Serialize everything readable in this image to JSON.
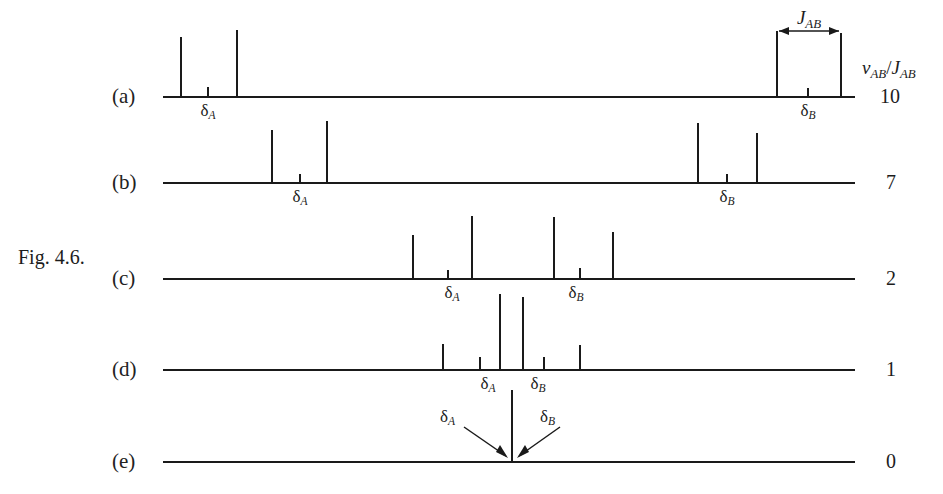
{
  "figure": {
    "caption": "Fig. 4.6.",
    "ratio_header_numerator": "ν",
    "ratio_header_num_sub": "AB",
    "ratio_header_denominator": "J",
    "ratio_header_den_sub": "AB",
    "j_coupling_label": "J",
    "j_coupling_sub": "AB",
    "delta_a_label": "δ",
    "delta_a_sub": "A",
    "delta_b_label": "δ",
    "delta_b_sub": "B"
  },
  "rows": [
    {
      "tag": "(a)",
      "ratio": "10",
      "baseline_y": 97,
      "tag_x": 112,
      "tag_y": 86
    },
    {
      "tag": "(b)",
      "ratio": "7",
      "baseline_y": 183,
      "tag_x": 112,
      "tag_y": 172
    },
    {
      "tag": "(c)",
      "ratio": "2",
      "baseline_y": 279,
      "tag_x": 112,
      "tag_y": 268
    },
    {
      "tag": "(d)",
      "ratio": "1",
      "baseline_y": 370,
      "tag_x": 112,
      "tag_y": 359
    },
    {
      "tag": "(e)",
      "ratio": "0",
      "baseline_y": 462,
      "tag_x": 112,
      "tag_y": 451
    }
  ],
  "chart_data": {
    "type": "bar",
    "title": "Fig. 4.6.",
    "subtitle": "Calculated AB-system NMR spectra as a function of νAB/JAB",
    "xlabel": "",
    "ylabel": "intensity",
    "grid": false,
    "legend": null,
    "axis_note": "each trace shares a common frequency axis from x=163 to x=855 px; heights in px above its own baseline",
    "traces": [
      {
        "label": "(a)",
        "ratio_vAB_over_JAB": 10,
        "baseline_y": 97,
        "peaks": [
          {
            "x": 181,
            "height": 60
          },
          {
            "x": 208,
            "height": 10
          },
          {
            "x": 237,
            "height": 67
          },
          {
            "x": 777,
            "height": 66
          },
          {
            "x": 808,
            "height": 9
          },
          {
            "x": 841,
            "height": 64
          }
        ],
        "annotations": [
          {
            "text": "δA",
            "x": 208,
            "y": 105
          },
          {
            "text": "δB",
            "x": 808,
            "y": 105
          },
          {
            "text": "JAB",
            "x": 809,
            "y": 10
          }
        ]
      },
      {
        "label": "(b)",
        "ratio_vAB_over_JAB": 7,
        "baseline_y": 183,
        "peaks": [
          {
            "x": 272,
            "height": 53
          },
          {
            "x": 300,
            "height": 9
          },
          {
            "x": 327,
            "height": 62
          },
          {
            "x": 698,
            "height": 60
          },
          {
            "x": 727,
            "height": 9
          },
          {
            "x": 757,
            "height": 50
          }
        ],
        "annotations": [
          {
            "text": "δA",
            "x": 300,
            "y": 191
          },
          {
            "text": "δB",
            "x": 727,
            "y": 191
          }
        ]
      },
      {
        "label": "(c)",
        "ratio_vAB_over_JAB": 2,
        "baseline_y": 279,
        "peaks": [
          {
            "x": 413,
            "height": 44
          },
          {
            "x": 448,
            "height": 9
          },
          {
            "x": 472,
            "height": 63
          },
          {
            "x": 554,
            "height": 62
          },
          {
            "x": 580,
            "height": 11
          },
          {
            "x": 613,
            "height": 47
          }
        ],
        "annotations": [
          {
            "text": "δA",
            "x": 452,
            "y": 287
          },
          {
            "text": "δB",
            "x": 576,
            "y": 287
          }
        ]
      },
      {
        "label": "(d)",
        "ratio_vAB_over_JAB": 1,
        "baseline_y": 370,
        "peaks": [
          {
            "x": 443,
            "height": 26
          },
          {
            "x": 480,
            "height": 13
          },
          {
            "x": 500,
            "height": 76
          },
          {
            "x": 523,
            "height": 73
          },
          {
            "x": 544,
            "height": 13
          },
          {
            "x": 580,
            "height": 25
          }
        ],
        "annotations": [
          {
            "text": "δA",
            "x": 487,
            "y": 378
          },
          {
            "text": "δB",
            "x": 537,
            "y": 378
          }
        ]
      },
      {
        "label": "(e)",
        "ratio_vAB_over_JAB": 0,
        "baseline_y": 462,
        "peaks": [
          {
            "x": 512,
            "height": 72
          }
        ],
        "annotations": [
          {
            "text": "δA",
            "x": 455,
            "y": 415,
            "arrow_to_x": 512,
            "arrow_to_y": 460
          },
          {
            "text": "δB",
            "x": 552,
            "y": 415,
            "arrow_to_x": 512,
            "arrow_to_y": 460
          }
        ]
      }
    ]
  }
}
